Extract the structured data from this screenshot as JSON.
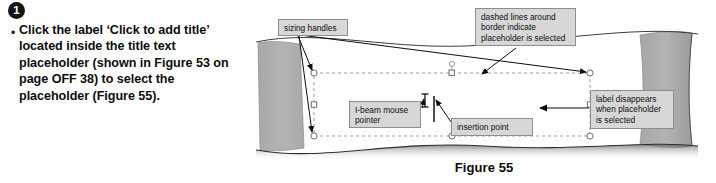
{
  "step": {
    "number": "1",
    "bullet_glyph": "•",
    "text": "Click the label ‘Click to add title’ located inside the title text placeholder (shown in Figure 53 on page OFF 38) to select the placeholder (Figure 55)."
  },
  "figure": {
    "caption": "Figure 55",
    "callouts": [
      {
        "id": "sizing-handles",
        "text": "sizing handles"
      },
      {
        "id": "dashed-border",
        "text": "dashed lines around\nborder indicate\nplaceholder is selected"
      },
      {
        "id": "ibeam-pointer",
        "text": "I-beam mouse\npointer"
      },
      {
        "id": "insertion-point",
        "text": "insertion point"
      },
      {
        "id": "label-disappears",
        "text": "label disappears\nwhen placeholder\nis selected"
      }
    ],
    "slide": {
      "placeholder_state": "selected",
      "border_style": "dashed",
      "handles": [
        "top-left",
        "top-center",
        "top-right",
        "middle-left",
        "middle-right",
        "bottom-left",
        "bottom-center",
        "bottom-right"
      ],
      "rotation_handle": true,
      "mouse_pointer": "i-beam",
      "insertion_point_visible": true
    },
    "colors": {
      "callout_fill": "#d7d7d7",
      "callout_border": "#8e8e8e",
      "page_shadow": "#b0b0b0",
      "slide_fill": "#ffffff",
      "dashed_border": "#9a9a9a",
      "leader_line": "#101010",
      "badge_fill": "#151515"
    }
  }
}
